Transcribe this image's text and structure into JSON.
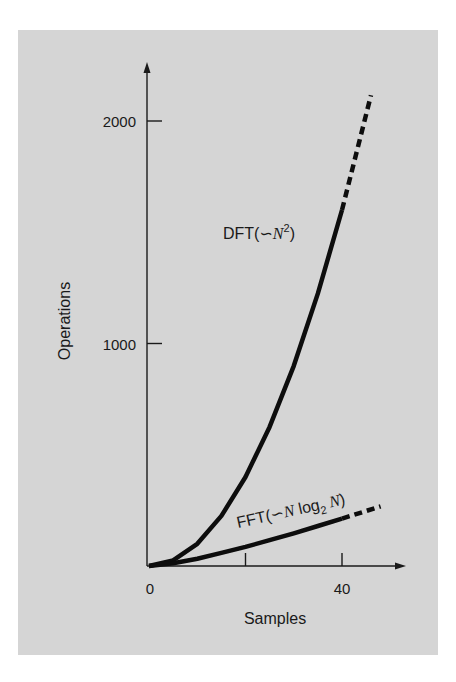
{
  "chart_data": {
    "type": "line",
    "title": "",
    "xlabel": "Samples",
    "ylabel": "Operations",
    "xlim": [
      0,
      50
    ],
    "ylim": [
      0,
      2200
    ],
    "x_ticks": [
      0,
      20,
      40
    ],
    "x_tick_labels": [
      "0",
      "",
      "40"
    ],
    "y_ticks": [
      1000,
      2000
    ],
    "y_tick_labels": [
      "1000",
      "2000"
    ],
    "grid": false,
    "legend": "inline labels",
    "series": [
      {
        "name": "DFT(~N^2)",
        "label_main": "DFT(",
        "label_var": "N",
        "label_sup": "2",
        "label_close": ")",
        "formula": "N^2",
        "x": [
          0,
          5,
          10,
          15,
          20,
          25,
          30,
          35,
          40,
          46
        ],
        "values": [
          0,
          25,
          100,
          225,
          400,
          625,
          900,
          1225,
          1600,
          2116
        ],
        "solid_until_x": 40,
        "dashed_after_x": 40
      },
      {
        "name": "FFT(~N log2 N)",
        "label_main": "FFT(",
        "label_var": "N",
        "label_log": " log",
        "label_sub": "2",
        "label_var2": " N",
        "label_close": ")",
        "formula": "N*log2(N)",
        "x": [
          0,
          5,
          10,
          15,
          20,
          25,
          30,
          35,
          40,
          48
        ],
        "values": [
          0,
          12,
          33,
          59,
          86,
          116,
          147,
          180,
          213,
          268
        ],
        "solid_until_x": 40,
        "dashed_after_x": 40
      }
    ],
    "annotations": [
      "DFT(~N²)",
      "FFT(~N log₂ N)"
    ]
  },
  "ui": {
    "tilde_symbol": "∽"
  }
}
